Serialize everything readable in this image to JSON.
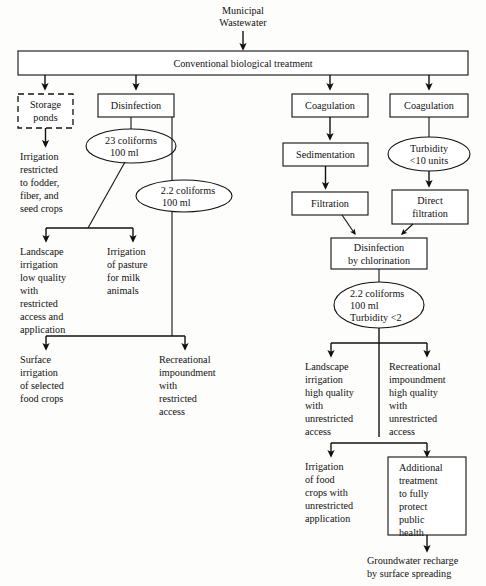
{
  "diagram": {
    "source_label": {
      "line1": "Municipal",
      "line2": "Wastewater"
    },
    "main_process": "Conventional biological treatment",
    "nodes": {
      "storage_ponds": {
        "line1": "Storage",
        "line2": "ponds"
      },
      "disinfection": "Disinfection",
      "coagulation_left": "Coagulation",
      "coagulation_right": "Coagulation",
      "sedimentation": "Sedimentation",
      "filtration": "Filtration",
      "direct_filtration": {
        "line1": "Direct",
        "line2": "filtration"
      },
      "disinfection_chlorination": {
        "line1": "Disinfection",
        "line2": "by chlorination"
      },
      "additional_treatment": {
        "line1": "Additional",
        "line2": "treatment",
        "line3": "to fully",
        "line4": "protect",
        "line5": "public",
        "line6": "health"
      }
    },
    "criteria": {
      "coliforms_23": {
        "line1": "23 coliforms",
        "line2": "100 ml"
      },
      "coliforms_22_left": {
        "line1": "2.2 coliforms",
        "line2": "100 ml"
      },
      "turbidity_10": {
        "line1": "Turbidity",
        "line2": "<10 units"
      },
      "coliforms_22_turbidity_2": {
        "line1": "2.2 coliforms",
        "line2": "100 ml",
        "line3": "Turbidity <2"
      }
    },
    "uses": {
      "irrigation_fodder": {
        "line1": "Irrigation",
        "line2": "restricted",
        "line3": "to fodder,",
        "line4": "fiber, and",
        "line5": "seed crops"
      },
      "landscape_low": {
        "line1": "Landscape",
        "line2": "irrigation",
        "line3": "low quality",
        "line4": "with",
        "line5": "restricted",
        "line6": "access and",
        "line7": "application"
      },
      "irrigation_pasture": {
        "line1": "Irrigation",
        "line2": "of pasture",
        "line3": "for milk",
        "line4": "animals"
      },
      "surface_irrigation": {
        "line1": "Surface",
        "line2": "irrigation",
        "line3": "of selected",
        "line4": "food crops"
      },
      "recreational_restricted": {
        "line1": "Recreational",
        "line2": "impoundment",
        "line3": "with",
        "line4": "restricted",
        "line5": "access"
      },
      "landscape_high": {
        "line1": "Landscape",
        "line2": "irrigation",
        "line3": "high quality",
        "line4": "with",
        "line5": "unrestricted",
        "line6": "access"
      },
      "recreational_unrestricted": {
        "line1": "Recreational",
        "line2": "impoundment",
        "line3": "high quality",
        "line4": "with",
        "line5": "unrestricted",
        "line6": "access"
      },
      "irrigation_food_crops": {
        "line1": "Irrigation",
        "line2": "of food",
        "line3": "crops with",
        "line4": "unrestricted",
        "line5": "application"
      },
      "groundwater_recharge": {
        "line1": "Groundwater recharge",
        "line2": "by surface spreading"
      }
    },
    "colors": {
      "stroke": "#111111",
      "fill": "#ffffff",
      "background": "#fdfdfb"
    }
  }
}
